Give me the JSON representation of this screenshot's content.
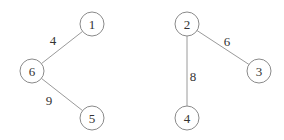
{
  "graph": {
    "nodes": [
      {
        "id": "1",
        "label": "1",
        "x": 92,
        "y": 24
      },
      {
        "id": "6",
        "label": "6",
        "x": 32,
        "y": 71
      },
      {
        "id": "5",
        "label": "5",
        "x": 92,
        "y": 118
      },
      {
        "id": "2",
        "label": "2",
        "x": 187,
        "y": 24
      },
      {
        "id": "3",
        "label": "3",
        "x": 259,
        "y": 71
      },
      {
        "id": "4",
        "label": "4",
        "x": 187,
        "y": 118
      }
    ],
    "edges": [
      {
        "from": "1",
        "to": "6",
        "weight": "4",
        "lx": 53,
        "ly": 45
      },
      {
        "from": "6",
        "to": "5",
        "weight": "9",
        "lx": 49,
        "ly": 105
      },
      {
        "from": "2",
        "to": "3",
        "weight": "6",
        "lx": 227,
        "ly": 46
      },
      {
        "from": "2",
        "to": "4",
        "weight": "8",
        "lx": 193,
        "ly": 81
      }
    ],
    "node_radius": 12,
    "colors": {
      "node_stroke": "#8a8a8a",
      "edge": "#9a9a9a",
      "text": "#333333"
    }
  }
}
